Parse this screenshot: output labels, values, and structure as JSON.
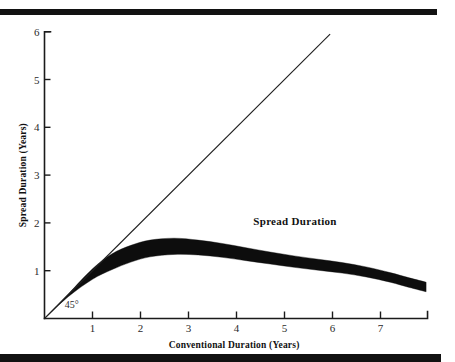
{
  "figure": {
    "rules": {
      "top": "horizontal-rule",
      "bottom": "horizontal-rule"
    },
    "annotation": "Spread Duration",
    "angle_label": "45°"
  },
  "chart_data": {
    "type": "area",
    "title": "",
    "subtitle": "",
    "xlabel": "Conventional Duration (Years)",
    "ylabel": "Spread Duration (Years)",
    "xlim": [
      0,
      8
    ],
    "ylim": [
      0,
      6.3
    ],
    "grid": false,
    "legend_position": "inline-annotation",
    "xticks": [
      1,
      2,
      3,
      4,
      5,
      6,
      7
    ],
    "xtick_labels": [
      "1",
      "2",
      "3",
      "4",
      "5",
      "6",
      "7"
    ],
    "yticks": [
      1,
      2,
      3,
      4,
      5,
      6
    ],
    "ytick_labels": [
      "1",
      "2",
      "3",
      "4",
      "5",
      "6"
    ],
    "annotations": [
      {
        "text": "Spread Duration",
        "x": 4.35,
        "y": 1.95
      },
      {
        "text": "45°",
        "x": 0.42,
        "y": 0.22
      }
    ],
    "series": [
      {
        "name": "45° reference line",
        "type": "line",
        "x": [
          0,
          5.95
        ],
        "values": [
          0,
          5.95
        ]
      },
      {
        "name": "Spread Duration band (upper bound)",
        "type": "line",
        "x": [
          0,
          0.5,
          1.0,
          1.4,
          1.8,
          2.2,
          2.7,
          3.2,
          3.7,
          4.2,
          4.7,
          5.2,
          5.7,
          6.2,
          6.7,
          7.2,
          7.6,
          7.95
        ],
        "values": [
          0,
          0.52,
          1.04,
          1.35,
          1.53,
          1.64,
          1.68,
          1.64,
          1.57,
          1.48,
          1.39,
          1.31,
          1.24,
          1.17,
          1.08,
          0.96,
          0.85,
          0.76
        ]
      },
      {
        "name": "Spread Duration band (lower bound)",
        "type": "line",
        "x": [
          0,
          0.5,
          1.0,
          1.4,
          1.8,
          2.2,
          2.7,
          3.2,
          3.7,
          4.2,
          4.7,
          5.2,
          5.7,
          6.2,
          6.7,
          7.2,
          7.6,
          7.95
        ],
        "values": [
          0,
          0.46,
          0.82,
          1.02,
          1.18,
          1.29,
          1.34,
          1.33,
          1.28,
          1.21,
          1.14,
          1.07,
          1.01,
          0.95,
          0.87,
          0.76,
          0.65,
          0.56
        ]
      }
    ]
  }
}
